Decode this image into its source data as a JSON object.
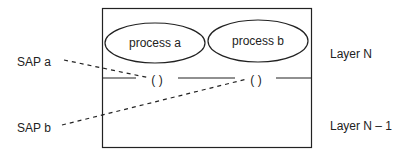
{
  "diagram": {
    "layers": [
      {
        "label": "Layer N"
      },
      {
        "label": "Layer N – 1"
      }
    ],
    "processes": [
      {
        "label": "process a"
      },
      {
        "label": "process b"
      }
    ],
    "saps": [
      {
        "label": "SAP a",
        "symbol": "( )"
      },
      {
        "label": "SAP b",
        "symbol": "( )"
      }
    ],
    "colors": {
      "stroke": "#222222",
      "background": "#ffffff"
    }
  }
}
